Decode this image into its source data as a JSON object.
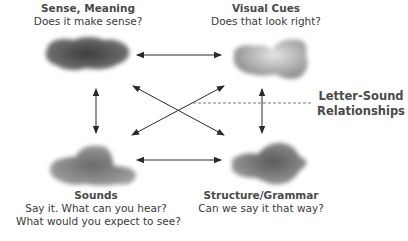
{
  "diagram": {
    "nodes": [
      {
        "id": "sense-meaning",
        "title": "Sense, Meaning",
        "lines": [
          "Does it make sense?"
        ],
        "cloud_color": "#505050"
      },
      {
        "id": "visual-cues",
        "title": "Visual Cues",
        "lines": [
          "Does that look right?"
        ],
        "cloud_color": "#a8a8a8"
      },
      {
        "id": "sounds",
        "title": "Sounds",
        "lines": [
          "Say it. What can you hear?",
          "What would you expect to see?"
        ],
        "cloud_color": "#7a7a7a"
      },
      {
        "id": "structure-grammar",
        "title": "Structure/Grammar",
        "lines": [
          "Can we say it that way?"
        ],
        "cloud_color": "#6e6e6e"
      }
    ],
    "side_label": {
      "line1": "Letter-Sound",
      "line2": "Relationships"
    },
    "connections": [
      {
        "from": "sense-meaning",
        "to": "visual-cues",
        "type": "bidirectional"
      },
      {
        "from": "sounds",
        "to": "structure-grammar",
        "type": "bidirectional"
      },
      {
        "from": "sense-meaning",
        "to": "sounds",
        "type": "bidirectional"
      },
      {
        "from": "visual-cues",
        "to": "structure-grammar",
        "type": "bidirectional"
      },
      {
        "from": "sense-meaning",
        "to": "structure-grammar",
        "type": "bidirectional"
      },
      {
        "from": "visual-cues",
        "to": "sounds",
        "type": "bidirectional"
      },
      {
        "from": "center",
        "to": "letter-sound-relationships",
        "type": "dashed"
      }
    ],
    "colors": {
      "arrow": "#2a2a2a",
      "text": "#3a3a3a"
    }
  }
}
